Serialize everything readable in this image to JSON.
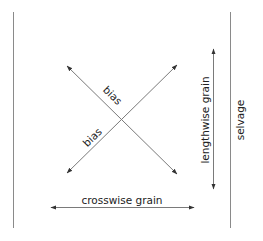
{
  "diagram": {
    "labels": {
      "bias_upper": "bias",
      "bias_lower": "bias",
      "lengthwise": "lengthwise grain",
      "selvage": "selvage",
      "crosswise": "crosswise grain"
    },
    "colors": {
      "line": "#7a7a7a",
      "arrow": "#333333",
      "text": "#222222"
    }
  }
}
